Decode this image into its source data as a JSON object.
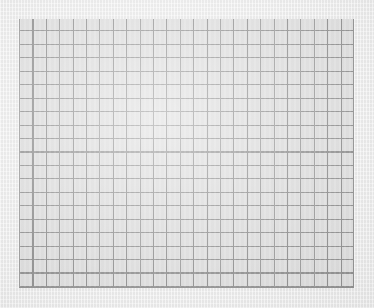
{
  "surface": {
    "kind": "graph-paper-sheet",
    "width": 374,
    "height": 308,
    "paper_color": "#e8e8e8",
    "caption": ""
  },
  "grid": {
    "label": "",
    "columns": 25,
    "rows": 20,
    "cell_width": 13.4,
    "cell_height": 13.45,
    "left": 19,
    "top": 19,
    "width": 335,
    "height": 269,
    "line_color": "#858585",
    "cell_fill": "#d9d9d9",
    "line_width": 1,
    "cells": []
  },
  "chart_data": {
    "type": "table",
    "title": "",
    "xlabel": "",
    "ylabel": "",
    "categories": [],
    "values": [],
    "grid": true,
    "legend": "none",
    "note": "Blank ruled grid; no plotted data, labels, ticks or legend are present."
  }
}
